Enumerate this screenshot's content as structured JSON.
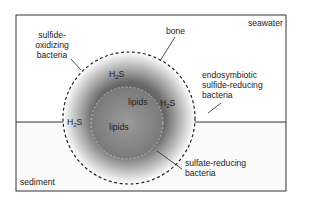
{
  "diagram": {
    "regions": {
      "top": "seawater",
      "bottom": "sediment"
    },
    "labels": {
      "sulfide_oxidizing": [
        "sulfide-",
        "oxidizing",
        "bacteria"
      ],
      "bone": "bone",
      "endosymbiotic": [
        "endosymbiotic",
        "sulfide-reducing",
        "bacteria"
      ],
      "sulfate_reducing": [
        "sulfate-reducing",
        "bacteria"
      ],
      "lipids_1": "lipids",
      "lipids_2": "lipids",
      "h2s_1": {
        "base": "H",
        "sub": "2",
        "rest": "S"
      },
      "h2s_2": {
        "base": "H",
        "sub": "2",
        "rest": "S"
      },
      "h2s_3": {
        "base": "H",
        "sub": "2",
        "rest": "S"
      }
    }
  }
}
